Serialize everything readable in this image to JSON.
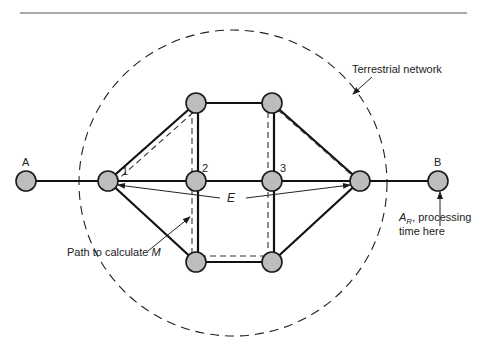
{
  "diagram": {
    "title_rule": true,
    "labels": {
      "terrestrial_network": "Terrestrial network",
      "node_A": "A",
      "node_B": "B",
      "node_1": "1",
      "node_2": "2",
      "node_3": "3",
      "E": "E",
      "path_label_prefix": "Path to calculate ",
      "path_label_var": "M",
      "ar_label_main": "A",
      "ar_label_sub": "R",
      "ar_label_rest": ", processing",
      "ar_label_line2": "time here"
    },
    "nodes": [
      {
        "id": "A",
        "label": "A"
      },
      {
        "id": "n1",
        "label": "1"
      },
      {
        "id": "n2",
        "label": "2"
      },
      {
        "id": "n3",
        "label": "3"
      },
      {
        "id": "hub",
        "label": ""
      },
      {
        "id": "B",
        "label": "B"
      },
      {
        "id": "tl",
        "label": ""
      },
      {
        "id": "tr",
        "label": ""
      },
      {
        "id": "bl",
        "label": ""
      },
      {
        "id": "br",
        "label": ""
      }
    ],
    "links": [
      [
        "A",
        "n1"
      ],
      [
        "n1",
        "n2"
      ],
      [
        "n2",
        "n3"
      ],
      [
        "n3",
        "hub"
      ],
      [
        "hub",
        "B"
      ],
      [
        "n1",
        "tl"
      ],
      [
        "tl",
        "tr"
      ],
      [
        "tr",
        "hub"
      ],
      [
        "n1",
        "bl"
      ],
      [
        "bl",
        "br"
      ],
      [
        "br",
        "hub"
      ],
      [
        "tl",
        "n2"
      ],
      [
        "n2",
        "bl"
      ],
      [
        "tr",
        "n3"
      ],
      [
        "n3",
        "br"
      ]
    ],
    "path_M": [
      "n1",
      "tl",
      "bl",
      "br",
      "tr",
      "hub"
    ]
  }
}
